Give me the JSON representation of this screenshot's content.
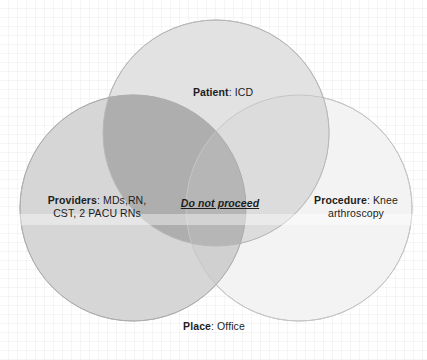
{
  "diagram": {
    "type": "venn",
    "set_count": 3,
    "background": "#ffffff",
    "grid_color": "#f0f0f0",
    "outline_color": "#b4b4b4",
    "sets": [
      {
        "id": "patient",
        "position": "top",
        "label_bold": "Patient",
        "label_rest": ": ICD",
        "fill": "#e2e2e2",
        "center_x": 216,
        "center_y": 133,
        "radius": 113
      },
      {
        "id": "providers",
        "position": "left",
        "label_bold": "Providers",
        "label_rest": ": MDs,RN,",
        "label_line2": "CST, 2 PACU RNs",
        "fill": "#d6d6d6",
        "center_x": 133,
        "center_y": 208,
        "radius": 113
      },
      {
        "id": "procedure",
        "position": "right",
        "label_bold": "Procedure",
        "label_rest": ": Knee",
        "label_line2": "arthroscopy",
        "fill": "#f3f3f3",
        "center_x": 299,
        "center_y": 208,
        "radius": 113
      }
    ],
    "footer": {
      "label_bold": "Place",
      "label_rest": ": Office"
    },
    "center_annotation": {
      "text": "Do not proceed",
      "style": "bold-italic-underline",
      "color": "#1d1d1d",
      "region": "providers-patient-overlap"
    }
  }
}
